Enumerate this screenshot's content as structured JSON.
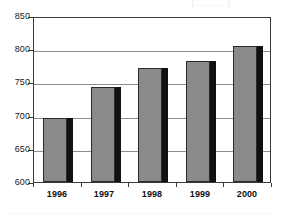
{
  "title_remnant": "(............)",
  "colors": {
    "bar_fill": "#8a8a8a",
    "bar_outline": "#2b2b2b",
    "bar_shadow": "#111111",
    "gridline": "#8d8d8d",
    "axis": "#3a3a3a",
    "text": "#111111",
    "background": "#ffffff"
  },
  "axes": {
    "y_ticks": [
      "600",
      "650",
      "700",
      "750",
      "800",
      "850"
    ],
    "x_ticks": [
      "1996",
      "1997",
      "1998",
      "1999",
      "2000"
    ]
  },
  "chart_data": {
    "type": "bar",
    "title": "",
    "subtitle": "",
    "xlabel": "",
    "ylabel": "",
    "categories": [
      "1996",
      "1997",
      "1998",
      "1999",
      "2000"
    ],
    "values": [
      696,
      743,
      771,
      782,
      805
    ],
    "ylim": [
      600,
      850
    ],
    "ytick_values": [
      600,
      650,
      700,
      750,
      800,
      850
    ],
    "grid": true,
    "legend": "none",
    "series": [
      {
        "name": "",
        "values": [
          696,
          743,
          771,
          782,
          805
        ]
      }
    ],
    "style": "3d-shadowed-vertical-bars",
    "annotations": []
  }
}
